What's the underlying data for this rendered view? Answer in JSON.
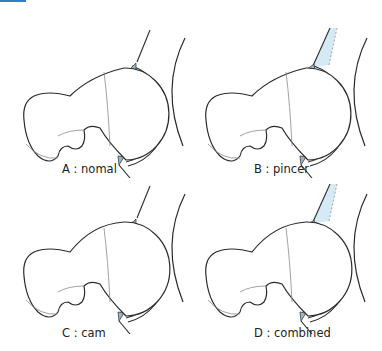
{
  "colors": {
    "accent_bar": "#2e7fc1",
    "line": "#2a2a2a",
    "thin_line": "#8a8a8a",
    "impingement_fill": "#d6eaf6",
    "labrum_fill": "#9fb6c8"
  },
  "panels": [
    {
      "id": "A",
      "caption": "A : nomal",
      "type": "normal"
    },
    {
      "id": "B",
      "caption": "B : pincer",
      "type": "pincer"
    },
    {
      "id": "C",
      "caption": "C : cam",
      "type": "cam"
    },
    {
      "id": "D",
      "caption": "D : combined",
      "type": "combined"
    }
  ]
}
